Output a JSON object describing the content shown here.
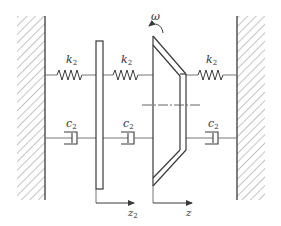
{
  "diagram": {
    "title": "",
    "omega_label": "ω",
    "springs": [
      {
        "id": "spring-left",
        "label": "k",
        "subscript": "2"
      },
      {
        "id": "spring-middle",
        "label": "k",
        "subscript": "2"
      },
      {
        "id": "spring-right",
        "label": "k",
        "subscript": "2"
      }
    ],
    "dampers": [
      {
        "id": "damper-left",
        "label": "c",
        "subscript": "2"
      },
      {
        "id": "damper-middle",
        "label": "c",
        "subscript": "2"
      },
      {
        "id": "damper-right",
        "label": "c",
        "subscript": "2"
      }
    ],
    "axes": [
      {
        "id": "axis-z2",
        "label": "z",
        "subscript": "2"
      },
      {
        "id": "axis-z",
        "label": "z",
        "subscript": ""
      }
    ],
    "colors": {
      "line": "#3a3a3a",
      "hatch": "#8a8a8a",
      "background": "#ffffff"
    }
  }
}
